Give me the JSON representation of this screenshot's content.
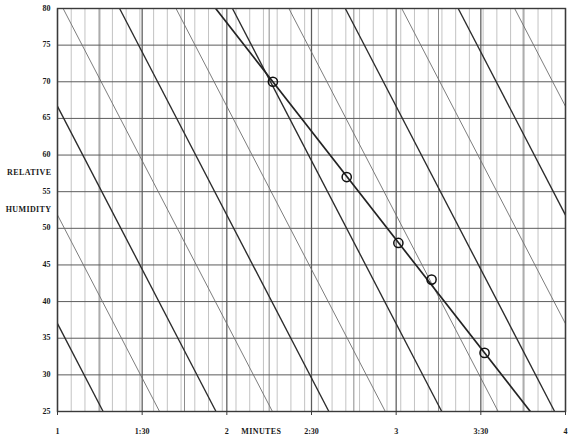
{
  "chart_data": {
    "type": "line",
    "title": "",
    "xlabel": "MINUTES",
    "ylabel": "RELATIVE HUMIDITY",
    "ylabel_line1": "RELATIVE",
    "ylabel_line2": "HUMIDITY",
    "xlim": [
      1,
      4
    ],
    "ylim": [
      25,
      80
    ],
    "grid": true,
    "legend": false,
    "y_ticks": [
      80,
      75,
      70,
      65,
      60,
      55,
      50,
      45,
      40,
      35,
      30,
      25
    ],
    "y_tick_labels": [
      "80",
      "75",
      "70",
      "65",
      "60",
      "55",
      "50",
      "45",
      "40",
      "35",
      "30",
      "25"
    ],
    "x_ticks": [
      1,
      1.5,
      2,
      2.5,
      3,
      3.5,
      4
    ],
    "x_tick_labels": [
      "1",
      "1:30",
      "2",
      "2:30",
      "3",
      "3:30",
      "4"
    ],
    "x_minor_step": 0.0555,
    "y_minor_grid": false,
    "series": [
      {
        "name": "measured-humidity-curve",
        "marker": "open-circle",
        "emphasis": "heavy",
        "points": [
          {
            "x": 2.272,
            "y": 70,
            "label": "70"
          },
          {
            "x": 2.708,
            "y": 57,
            "label": "57"
          },
          {
            "x": 3.013,
            "y": 48,
            "label": "48"
          },
          {
            "x": 3.209,
            "y": 43,
            "label": "43"
          },
          {
            "x": 3.522,
            "y": 33,
            "label": "33"
          }
        ]
      }
    ],
    "reference_lines": {
      "description": "family of parallel descending reference lines, alternating heavy and light weight",
      "slope_per_minute": -44.5,
      "count": 14,
      "heavy_color": "#2b2b2b",
      "light_color": "#6e6e6e"
    },
    "colors": {
      "axis": "#3a3a3a",
      "major_grid": "#5c5c5c",
      "minor_grid": "#9a9a9a",
      "data_line": "#232323",
      "marker_stroke": "#111111",
      "background": "#ffffff"
    }
  },
  "axis_labels": {
    "x_axis_title": "MINUTES",
    "y_axis_title_line1": "RELATIVE",
    "y_axis_title_line2": "HUMIDITY"
  }
}
